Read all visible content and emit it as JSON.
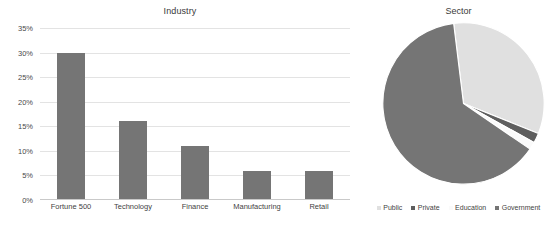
{
  "chart_data": [
    {
      "type": "bar",
      "title": "Industry",
      "xlabel": "",
      "ylabel": "",
      "categories": [
        "Fortune 500",
        "Technology",
        "Finance",
        "Manufacturing",
        "Retail"
      ],
      "values": [
        30,
        16,
        11,
        6,
        6
      ],
      "ylim": [
        0,
        35
      ],
      "ytick_labels": [
        "0%",
        "5%",
        "10%",
        "15%",
        "20%",
        "25%",
        "30%",
        "35%"
      ],
      "ytick_values": [
        0,
        5,
        10,
        15,
        20,
        25,
        30,
        35
      ],
      "grid": true,
      "legend": "none",
      "bar_color": "#757575"
    },
    {
      "type": "pie",
      "title": "Sector",
      "labels": [
        "Public",
        "Private",
        "Education",
        "Government"
      ],
      "values": [
        33,
        2,
        1.5,
        63.5
      ],
      "colors": [
        "#e0e0e0",
        "#5e5e5e",
        "#fafafa",
        "#757575"
      ],
      "legend": "bottom",
      "start_angle_deg": -7
    }
  ],
  "bar_chart": {
    "title": "Industry",
    "y_labels": [
      "35%",
      "30%",
      "25%",
      "20%",
      "15%",
      "10%",
      "5%",
      "0%"
    ],
    "x_labels": [
      "Fortune 500",
      "Technology",
      "Finance",
      "Manufacturing",
      "Retail"
    ]
  },
  "pie_chart": {
    "title": "Sector",
    "legend": [
      {
        "label": "Public",
        "color": "#e0e0e0"
      },
      {
        "label": "Private",
        "color": "#5e5e5e"
      },
      {
        "label": "Education",
        "color": "#fafafa"
      },
      {
        "label": "Government",
        "color": "#757575"
      }
    ]
  },
  "colors": {
    "bar": "#757575",
    "grid": "#e3e3e3",
    "axis": "#c9c9c9",
    "text": "#3f3f3f",
    "background": "#ffffff"
  }
}
